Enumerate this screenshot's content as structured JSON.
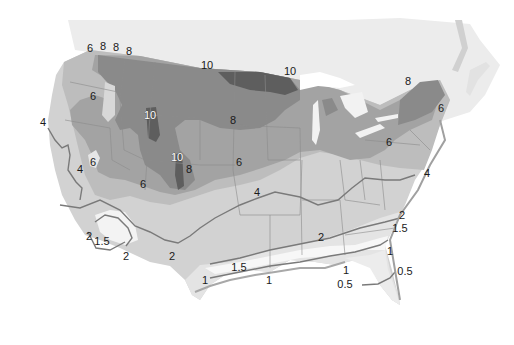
{
  "map": {
    "type": "contour map",
    "region": "United States (contiguous)",
    "zone_colors": {
      "canada_land": "#ececec",
      "zone_lt1": "#f7f7f7",
      "zone_1_2": "#e4e4e4",
      "zone_2_4": "#d2d2d2",
      "zone_4_6": "#bdbdbd",
      "zone_6_8": "#a3a3a3",
      "zone_8_10": "#8a8a8a",
      "zone_gt10": "#5e5e5e",
      "contour_line": "#7a7a7a",
      "state_line": "#8c8c8c"
    },
    "labels": [
      {
        "id": "nw-6",
        "text": "6",
        "x": 90,
        "y": 52
      },
      {
        "id": "nw-8a",
        "text": "8",
        "x": 103,
        "y": 50
      },
      {
        "id": "nw-8b",
        "text": "8",
        "x": 116,
        "y": 51
      },
      {
        "id": "nw-8c",
        "text": "8",
        "x": 129,
        "y": 55
      },
      {
        "id": "north-10",
        "text": "10",
        "x": 207,
        "y": 69
      },
      {
        "id": "lakes-10",
        "text": "10",
        "x": 290,
        "y": 75
      },
      {
        "id": "ne-8",
        "text": "8",
        "x": 408,
        "y": 85
      },
      {
        "id": "ne-6a",
        "text": "6",
        "x": 441,
        "y": 112
      },
      {
        "id": "ne-6b",
        "text": "6",
        "x": 389,
        "y": 146
      },
      {
        "id": "mt-6",
        "text": "6",
        "x": 93,
        "y": 100
      },
      {
        "id": "mt-10",
        "text": "10",
        "x": 150,
        "y": 119,
        "light": true
      },
      {
        "id": "plains-8",
        "text": "8",
        "x": 233,
        "y": 124
      },
      {
        "id": "west-4",
        "text": "4",
        "x": 43,
        "y": 126
      },
      {
        "id": "nv-6",
        "text": "6",
        "x": 93,
        "y": 166
      },
      {
        "id": "co-10",
        "text": "10",
        "x": 177,
        "y": 161,
        "light": true
      },
      {
        "id": "co-8",
        "text": "8",
        "x": 189,
        "y": 173
      },
      {
        "id": "mid-6",
        "text": "6",
        "x": 239,
        "y": 166
      },
      {
        "id": "ca-4",
        "text": "4",
        "x": 80,
        "y": 173
      },
      {
        "id": "az-6",
        "text": "6",
        "x": 143,
        "y": 188
      },
      {
        "id": "mid-4",
        "text": "4",
        "x": 257,
        "y": 196
      },
      {
        "id": "va-4",
        "text": "4",
        "x": 427,
        "y": 177
      },
      {
        "id": "sc-2",
        "text": "2",
        "x": 402,
        "y": 219
      },
      {
        "id": "sc-1.5",
        "text": "1.5",
        "x": 400,
        "y": 232
      },
      {
        "id": "sw-2a",
        "text": "2",
        "x": 89,
        "y": 240
      },
      {
        "id": "sw-1.5",
        "text": "1.5",
        "x": 102,
        "y": 245
      },
      {
        "id": "sw-2b",
        "text": "2",
        "x": 126,
        "y": 260
      },
      {
        "id": "nm-2",
        "text": "2",
        "x": 172,
        "y": 260
      },
      {
        "id": "gulf-2",
        "text": "2",
        "x": 321,
        "y": 241
      },
      {
        "id": "tx-1.5",
        "text": "1.5",
        "x": 239,
        "y": 271
      },
      {
        "id": "tx-1",
        "text": "1",
        "x": 205,
        "y": 284
      },
      {
        "id": "la-1",
        "text": "1",
        "x": 269,
        "y": 284
      },
      {
        "id": "ga-1",
        "text": "1",
        "x": 390,
        "y": 255
      },
      {
        "id": "fl-1",
        "text": "1",
        "x": 346,
        "y": 274
      },
      {
        "id": "fl-0.5a",
        "text": "0.5",
        "x": 405,
        "y": 275
      },
      {
        "id": "fl-0.5b",
        "text": "0.5",
        "x": 345,
        "y": 288
      }
    ]
  }
}
